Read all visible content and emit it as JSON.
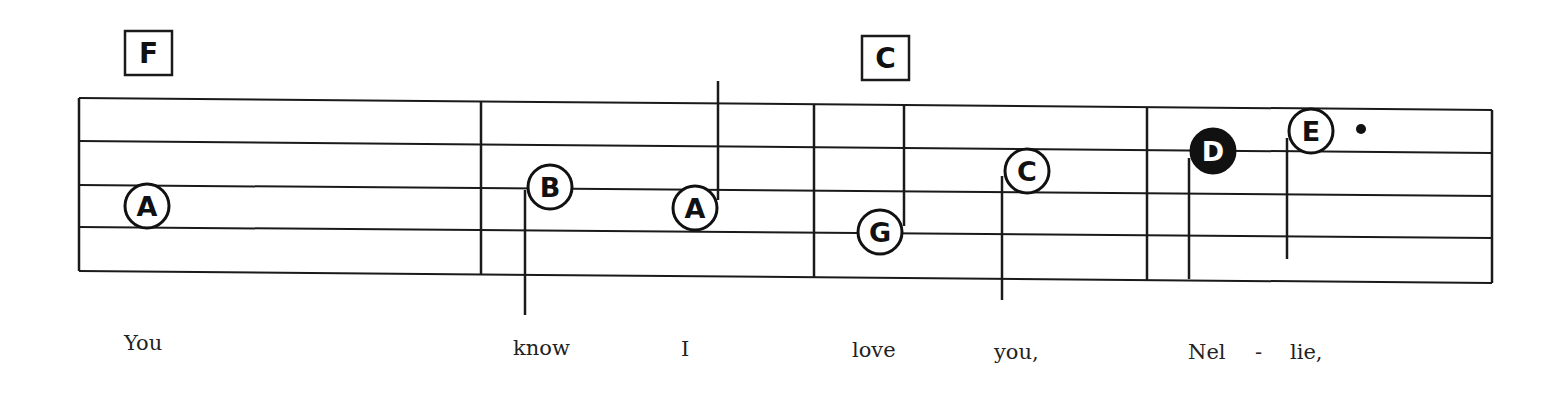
{
  "score": {
    "staff": {
      "left_x": 79,
      "right_x": 1492,
      "lines_left_y": [
        98,
        141,
        185,
        227,
        271
      ],
      "lines_right_y": [
        110,
        153,
        196,
        238,
        283
      ]
    },
    "barlines": [
      {
        "x": 481,
        "y1": 101,
        "y2": 274
      },
      {
        "x": 814,
        "y1": 104,
        "y2": 277
      },
      {
        "x": 1147,
        "y1": 107,
        "y2": 280
      }
    ],
    "chords": [
      {
        "label": "F",
        "x": 125,
        "y": 31,
        "w": 47,
        "h": 44
      },
      {
        "label": "C",
        "x": 862,
        "y": 36,
        "w": 47,
        "h": 44
      }
    ],
    "notes": [
      {
        "letter": "A",
        "cx": 147,
        "cy": 206,
        "filled": false,
        "stem": null
      },
      {
        "letter": "B",
        "cx": 550,
        "cy": 187,
        "filled": false,
        "stem": {
          "x": 525,
          "y1": 190,
          "y2": 315
        }
      },
      {
        "letter": "A",
        "cx": 695,
        "cy": 208,
        "filled": false,
        "stem": {
          "x": 718,
          "y1": 81,
          "y2": 200
        }
      },
      {
        "letter": "G",
        "cx": 880,
        "cy": 232,
        "filled": false,
        "stem": {
          "x": 904,
          "y1": 104,
          "y2": 226
        }
      },
      {
        "letter": "C",
        "cx": 1027,
        "cy": 171,
        "filled": false,
        "stem": {
          "x": 1002,
          "y1": 176,
          "y2": 300
        }
      },
      {
        "letter": "D",
        "cx": 1213,
        "cy": 151,
        "filled": true,
        "stem": {
          "x": 1189,
          "y1": 158,
          "y2": 279
        }
      },
      {
        "letter": "E",
        "cx": 1311,
        "cy": 131,
        "filled": false,
        "stem": {
          "x": 1287,
          "y1": 138,
          "y2": 259
        }
      }
    ],
    "dots": [
      {
        "cx": 1361,
        "cy": 129,
        "r": 5
      }
    ],
    "lyrics": [
      {
        "text": "You",
        "x": 124,
        "y": 350
      },
      {
        "text": "know",
        "x": 513,
        "y": 355
      },
      {
        "text": "I",
        "x": 681,
        "y": 356
      },
      {
        "text": "love",
        "x": 852,
        "y": 357
      },
      {
        "text": "you,",
        "x": 994,
        "y": 359
      },
      {
        "text": "Nel",
        "x": 1188,
        "y": 359
      },
      {
        "text": "-",
        "x": 1255,
        "y": 359
      },
      {
        "text": "lie,",
        "x": 1290,
        "y": 359
      }
    ]
  }
}
